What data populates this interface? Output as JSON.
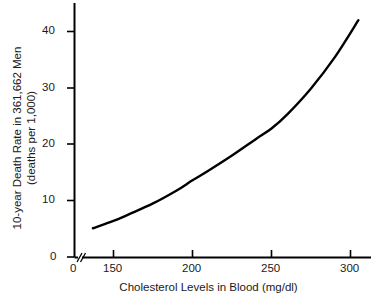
{
  "chart_data": {
    "type": "line",
    "title": "",
    "xlabel": "Cholesterol Levels in Blood (mg/dl)",
    "ylabel_line1": "10-year Death Rate in 361,662 Men",
    "ylabel_line2": "(deaths per 1,000)",
    "xlim": [
      137,
      305
    ],
    "ylim": [
      0,
      43
    ],
    "grid": false,
    "legend": "none",
    "axis_break_x": true,
    "axis_break_note": "double-slash break between 0 and 150 on x-axis",
    "xticks": [
      0,
      150,
      200,
      250,
      300
    ],
    "xtick_labels": [
      "0",
      "150",
      "200",
      "250",
      "300"
    ],
    "yticks": [
      0,
      10,
      20,
      30,
      40
    ],
    "ytick_labels": [
      "0",
      "10",
      "20",
      "30",
      "40"
    ],
    "series": [
      {
        "name": "10-year death rate",
        "color": "#000000",
        "x": [
          137,
          150,
          160,
          175,
          190,
          200,
          210,
          225,
          240,
          250,
          260,
          275,
          290,
          305
        ],
        "values": [
          5.1,
          6.4,
          7.6,
          9.5,
          11.8,
          13.6,
          15.3,
          18.0,
          20.9,
          22.8,
          25.3,
          29.9,
          35.4,
          42.0
        ]
      }
    ]
  },
  "axes": {
    "x_zero_label": "0",
    "tick_color": "#000000"
  }
}
